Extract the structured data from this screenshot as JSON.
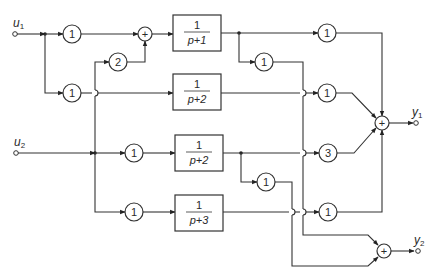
{
  "inputs": [
    {
      "label": "u",
      "sub": "1"
    },
    {
      "label": "u",
      "sub": "2"
    }
  ],
  "outputs": [
    {
      "label": "y",
      "sub": "1"
    },
    {
      "label": "y",
      "sub": "2"
    }
  ],
  "input_gains": {
    "u1_to_sum": "1",
    "u2_to_sum": "2",
    "u1_to_block2": "1",
    "u2_to_block3": "1",
    "u2_to_block4": "1"
  },
  "sum_sign": "+",
  "blocks": [
    {
      "num": "1",
      "den": "p+1"
    },
    {
      "num": "1",
      "den": "p+2"
    },
    {
      "num": "1",
      "den": "p+2"
    },
    {
      "num": "1",
      "den": "p+3"
    }
  ],
  "output_gains": {
    "block1_to_y1": "1",
    "block1_to_y2": "1",
    "block2_to_y1": "1",
    "block3_to_y1": "3",
    "block3_to_y2": "1",
    "block4_to_y1": "1"
  }
}
